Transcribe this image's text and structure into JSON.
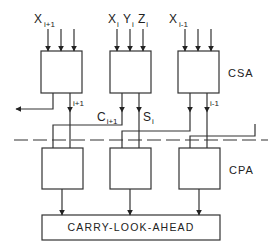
{
  "colors": {
    "stroke": "#333333",
    "text": "#222222",
    "background": "#ffffff"
  },
  "inputs": {
    "left": {
      "var": "X",
      "sub": "i+1"
    },
    "middle": [
      {
        "var": "X",
        "sub": "i"
      },
      {
        "var": "Y",
        "sub": "i"
      },
      {
        "var": "Z",
        "sub": "i"
      }
    ],
    "right": {
      "var": "X",
      "sub": "i-1"
    }
  },
  "stages": {
    "upper": "CSA",
    "lower": "CPA"
  },
  "signals": {
    "left_out": "i+1",
    "carry": {
      "var": "C",
      "sub": "i+1"
    },
    "sum": {
      "var": "S",
      "sub": "i"
    },
    "right_out": "i-1"
  },
  "bottom_block": "CARRY-LOOK-AHEAD"
}
